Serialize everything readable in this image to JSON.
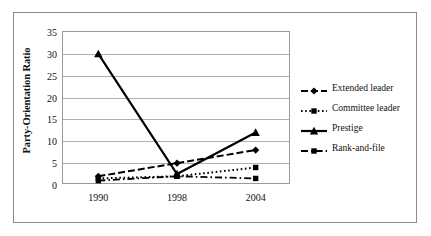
{
  "chart_data": {
    "type": "line",
    "title": "",
    "xlabel": "",
    "ylabel": "Party-Orientation Ratio",
    "categories": [
      "1990",
      "1998",
      "2004"
    ],
    "ylim": [
      0,
      35
    ],
    "yticks": [
      0,
      5,
      10,
      15,
      20,
      25,
      30,
      35
    ],
    "grid": true,
    "legend_position": "right",
    "series": [
      {
        "name": "Extended leader",
        "values": [
          2,
          5,
          8
        ],
        "line_style": "dashed",
        "marker": "diamond",
        "color": "#000000"
      },
      {
        "name": "Committee leader",
        "values": [
          1.5,
          2,
          4
        ],
        "line_style": "dotted",
        "marker": "square",
        "color": "#000000"
      },
      {
        "name": "Prestige",
        "values": [
          30,
          2.5,
          12
        ],
        "line_style": "solid",
        "marker": "triangle",
        "color": "#000000"
      },
      {
        "name": "Rank-and-file",
        "values": [
          1,
          2,
          1.5
        ],
        "line_style": "dashdot",
        "marker": "square",
        "color": "#000000"
      }
    ]
  },
  "axis": {
    "y_title": "Party-Orientation Ratio",
    "y_tick_labels": [
      "35",
      "30",
      "25",
      "20",
      "15",
      "10",
      "5",
      "0"
    ],
    "x_tick_labels": [
      "1990",
      "1998",
      "2004"
    ]
  },
  "legend": {
    "entries": [
      {
        "label": "Extended leader"
      },
      {
        "label": "Committee leader"
      },
      {
        "label": "Prestige"
      },
      {
        "label": "Rank-and-file"
      }
    ]
  },
  "colors": {
    "ink": "#000000",
    "gridline": "#b0b0b0",
    "frame": "#8a8a8a",
    "plot_border": "#9a9a9a",
    "background": "#ffffff"
  }
}
